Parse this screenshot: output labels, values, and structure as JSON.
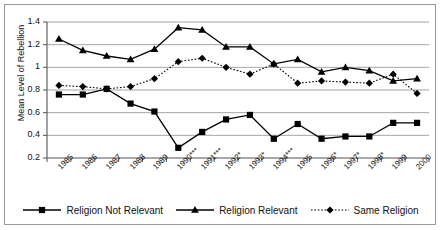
{
  "chart_data": {
    "type": "line",
    "title": "",
    "xlabel": "",
    "ylabel": "Mean Level of Rebellion",
    "ylim": [
      0.2,
      1.4
    ],
    "yticks": [
      "0.2",
      "0.4",
      "0.6",
      "0.8",
      "1",
      "1.2",
      "1.4"
    ],
    "ytick_values": [
      0.2,
      0.4,
      0.6,
      0.8,
      1.0,
      1.2,
      1.4
    ],
    "grid": true,
    "legend_position": "bottom",
    "categories": [
      "1985",
      "1986",
      "1987",
      "1988",
      "1989",
      "1990***",
      "1991***",
      "1992*",
      "1993*",
      "1994***",
      "1995",
      "1996*",
      "1997*",
      "1998*",
      "1999",
      "2000"
    ],
    "series": [
      {
        "name": "Religion Not Relevant",
        "marker": "square",
        "line_style": "solid",
        "color": "#000000",
        "values": [
          0.76,
          0.76,
          0.81,
          0.68,
          0.61,
          0.29,
          0.43,
          0.54,
          0.58,
          0.37,
          0.5,
          0.37,
          0.39,
          0.39,
          0.51,
          0.51
        ]
      },
      {
        "name": "Religion Relevant",
        "marker": "triangle",
        "line_style": "solid",
        "color": "#000000",
        "values": [
          1.25,
          1.15,
          1.1,
          1.07,
          1.16,
          1.35,
          1.33,
          1.18,
          1.18,
          1.03,
          1.07,
          0.96,
          1.0,
          0.97,
          0.88,
          0.9
        ]
      },
      {
        "name": "Same Religion",
        "marker": "diamond",
        "line_style": "dotted",
        "color": "#000000",
        "values": [
          0.84,
          0.83,
          0.81,
          0.83,
          0.9,
          1.05,
          1.08,
          1.0,
          0.94,
          1.03,
          0.86,
          0.88,
          0.87,
          0.86,
          0.94,
          0.77
        ]
      }
    ]
  },
  "legend": {
    "items": [
      {
        "label": "Religion Not Relevant",
        "marker": "square",
        "line_style": "solid"
      },
      {
        "label": "Religion Relevant",
        "marker": "triangle",
        "line_style": "solid"
      },
      {
        "label": "Same Religion",
        "marker": "diamond",
        "line_style": "dotted"
      }
    ]
  }
}
